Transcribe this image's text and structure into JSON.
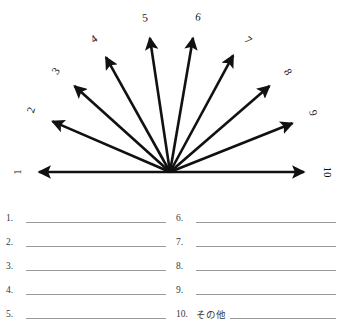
{
  "document": {
    "type": "ranking-worksheet",
    "background_color": "#ffffff",
    "ink_color": "#111111",
    "rule_color": "#9a9a9a"
  },
  "fan_diagram": {
    "name": "ten-ray-fan-scale",
    "center": {
      "x": 170,
      "y": 172
    },
    "rays": [
      {
        "label": "1",
        "tip_x": 33,
        "tip_y": 172,
        "label_x": 17,
        "label_y": 172,
        "label_rotation": -90
      },
      {
        "label": "2",
        "tip_x": 47,
        "tip_y": 119,
        "label_x": 31,
        "label_y": 110,
        "label_rotation": -72
      },
      {
        "label": "3",
        "tip_x": 70,
        "tip_y": 82,
        "label_x": 56,
        "label_y": 71,
        "label_rotation": -56
      },
      {
        "label": "4",
        "tip_x": 103,
        "tip_y": 52,
        "label_x": 94,
        "label_y": 39,
        "label_rotation": -36
      },
      {
        "label": "5",
        "tip_x": 149,
        "tip_y": 32,
        "label_x": 145,
        "label_y": 18,
        "label_rotation": -8
      },
      {
        "label": "6",
        "tip_x": 194,
        "tip_y": 32,
        "label_x": 198,
        "label_y": 17,
        "label_rotation": 10
      },
      {
        "label": "7",
        "tip_x": 236,
        "tip_y": 50,
        "label_x": 248,
        "label_y": 40,
        "label_rotation": 40
      },
      {
        "label": "8",
        "tip_x": 274,
        "tip_y": 82,
        "label_x": 288,
        "label_y": 72,
        "label_rotation": 58
      },
      {
        "label": "9",
        "tip_x": 298,
        "tip_y": 121,
        "label_x": 313,
        "label_y": 113,
        "label_rotation": 74
      },
      {
        "label": "10",
        "tip_x": 310,
        "tip_y": 172,
        "label_x": 327,
        "label_y": 172,
        "label_rotation": 90
      }
    ]
  },
  "answers": {
    "left_column": [
      {
        "number": "1.",
        "prefix": "",
        "value": ""
      },
      {
        "number": "2.",
        "prefix": "",
        "value": ""
      },
      {
        "number": "3.",
        "prefix": "",
        "value": ""
      },
      {
        "number": "4.",
        "prefix": "",
        "value": ""
      },
      {
        "number": "5.",
        "prefix": "",
        "value": ""
      }
    ],
    "right_column": [
      {
        "number": "6.",
        "prefix": "",
        "value": ""
      },
      {
        "number": "7.",
        "prefix": "",
        "value": ""
      },
      {
        "number": "8.",
        "prefix": "",
        "value": ""
      },
      {
        "number": "9.",
        "prefix": "",
        "value": ""
      },
      {
        "number": "10.",
        "prefix": "その他",
        "value": ""
      }
    ]
  }
}
